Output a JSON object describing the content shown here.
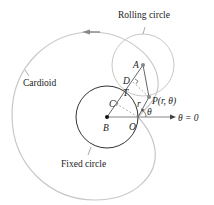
{
  "diagram": {
    "labels": {
      "rolling_circle": "Rolling circle",
      "cardioid": "Cardioid",
      "fixed_circle": "Fixed circle",
      "point_A": "A",
      "point_B": "B",
      "point_C": "C",
      "point_D": "D",
      "point_O": "O",
      "point_T": "T",
      "point_P": "P(r, θ)",
      "r": "r",
      "theta": "θ",
      "polar_axis": "θ = 0"
    },
    "colors": {
      "curve": "#c8c8c8",
      "fixed_circle": "#333333",
      "rolling_circle": "#c8c8c8",
      "lines": "#555555",
      "points": "#888888"
    }
  }
}
